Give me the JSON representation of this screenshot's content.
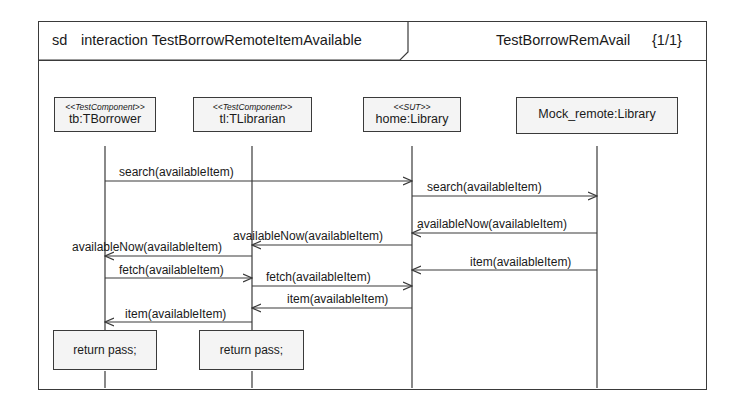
{
  "frame": {
    "kind": "sd",
    "title": "interaction TestBorrowRemoteItemAvailable",
    "right_label": "TestBorrowRemAvail",
    "page": "{1/1}"
  },
  "lifelines": [
    {
      "id": "tb",
      "stereotype": "<<TestComponent>>",
      "name": "tb:TBorrower"
    },
    {
      "id": "tl",
      "stereotype": "<<TestComponent>>",
      "name": "tl:TLibrarian"
    },
    {
      "id": "home",
      "stereotype": "<<SUT>>",
      "name": "home:Library"
    },
    {
      "id": "mock",
      "stereotype": "",
      "name": "Mock_remote:Library"
    }
  ],
  "messages": [
    {
      "from": "tb",
      "to": "home",
      "label": "search(availableItem)"
    },
    {
      "from": "home",
      "to": "mock",
      "label": "search(availableItem)"
    },
    {
      "from": "mock",
      "to": "home",
      "label": "availableNow(availableItem)"
    },
    {
      "from": "home",
      "to": "tl",
      "label": "availableNow(availableItem)"
    },
    {
      "from": "tl",
      "to": "tb",
      "label": "availableNow(availableItem)"
    },
    {
      "from": "mock",
      "to": "home",
      "label": "item(availableItem)"
    },
    {
      "from": "tb",
      "to": "tl",
      "label": "fetch(availableItem)"
    },
    {
      "from": "tl",
      "to": "home",
      "label": "fetch(availableItem)"
    },
    {
      "from": "home",
      "to": "tl",
      "label": "item(availableItem)"
    },
    {
      "from": "tl",
      "to": "tb",
      "label": "item(availableItem)"
    }
  ],
  "actions": [
    {
      "lifeline": "tb",
      "text": "return pass;"
    },
    {
      "lifeline": "tl",
      "text": "return pass;"
    }
  ]
}
